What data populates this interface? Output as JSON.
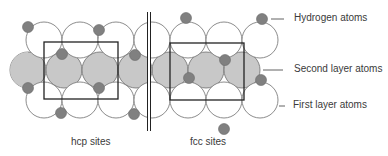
{
  "figure": {
    "type": "surface-adsorption-diagram",
    "legend": {
      "hydrogen": "Hydrogen atoms",
      "second_layer": "Second layer atoms",
      "first_layer": "First layer atoms"
    },
    "sites": {
      "hcp": "hcp sites",
      "fcc": "fcc sites"
    },
    "colors": {
      "first_layer_fill": "#ffffff",
      "second_layer_fill": "#c8c8c8",
      "hydrogen_fill": "#808080",
      "outline": "#6e6e6e",
      "box": "#222222"
    }
  }
}
